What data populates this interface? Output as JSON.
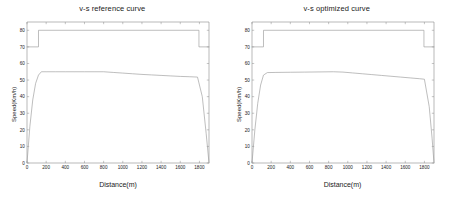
{
  "figure": {
    "background": "#ffffff",
    "axis_color": "#8a8a8a",
    "curve_color": "#9a9a9a"
  },
  "panels": [
    {
      "id": "reference",
      "title": "v-s reference curve",
      "ylabel": "Speed(Km/h)",
      "xlabel": "Distance(m)"
    },
    {
      "id": "optimized",
      "title": "v-s optimized curve",
      "ylabel": "Speed(Km/h)",
      "xlabel": "Distance(m)"
    }
  ],
  "chart_data": [
    {
      "type": "line",
      "title": "v-s reference curve",
      "xlabel": "Distance(m)",
      "ylabel": "Speed(Km/h)",
      "xlim": [
        0,
        1900
      ],
      "ylim": [
        0,
        85
      ],
      "xticks": [
        0,
        200,
        400,
        600,
        800,
        1000,
        1200,
        1400,
        1600,
        1800
      ],
      "yticks": [
        0,
        10,
        20,
        30,
        40,
        50,
        60,
        70,
        80
      ],
      "grid": false,
      "legend": "none",
      "series": [
        {
          "name": "speed limit",
          "style": "step",
          "x": [
            0,
            120,
            120,
            1795,
            1795,
            1900
          ],
          "y": [
            70,
            70,
            80,
            80,
            70,
            70
          ]
        },
        {
          "name": "reference speed",
          "style": "line",
          "x": [
            0,
            30,
            60,
            90,
            120,
            150,
            200,
            300,
            400,
            500,
            600,
            700,
            800,
            900,
            1000,
            1100,
            1200,
            1300,
            1400,
            1500,
            1600,
            1700,
            1780,
            1830,
            1870,
            1900
          ],
          "y": [
            0,
            22,
            38,
            48,
            53,
            55,
            55,
            55,
            55,
            55,
            55,
            55,
            55,
            54.6,
            54.2,
            53.8,
            53.4,
            53.1,
            52.8,
            52.5,
            52.2,
            52,
            51.8,
            40,
            18,
            0
          ]
        }
      ]
    },
    {
      "type": "line",
      "title": "v-s optimized curve",
      "xlabel": "Distance(m)",
      "ylabel": "Speed(Km/h)",
      "xlim": [
        0,
        1900
      ],
      "ylim": [
        0,
        85
      ],
      "xticks": [
        0,
        200,
        400,
        600,
        800,
        1000,
        1200,
        1400,
        1600,
        1800
      ],
      "yticks": [
        0,
        10,
        20,
        30,
        40,
        50,
        60,
        70,
        80
      ],
      "grid": false,
      "legend": "none",
      "series": [
        {
          "name": "speed limit",
          "style": "step",
          "x": [
            0,
            120,
            120,
            1795,
            1795,
            1900
          ],
          "y": [
            70,
            70,
            80,
            80,
            70,
            70
          ]
        },
        {
          "name": "optimized speed",
          "style": "line",
          "x": [
            0,
            30,
            60,
            90,
            120,
            160,
            250,
            400,
            550,
            700,
            850,
            950,
            1050,
            1150,
            1250,
            1350,
            1450,
            1550,
            1650,
            1750,
            1800,
            1850,
            1880,
            1900
          ],
          "y": [
            0,
            20,
            36,
            47,
            53,
            54.5,
            54.6,
            54.7,
            54.8,
            54.9,
            55,
            54.8,
            54.3,
            53.8,
            53.3,
            52.8,
            52.3,
            51.8,
            51.3,
            50.8,
            50.5,
            34,
            15,
            0
          ]
        }
      ]
    }
  ]
}
